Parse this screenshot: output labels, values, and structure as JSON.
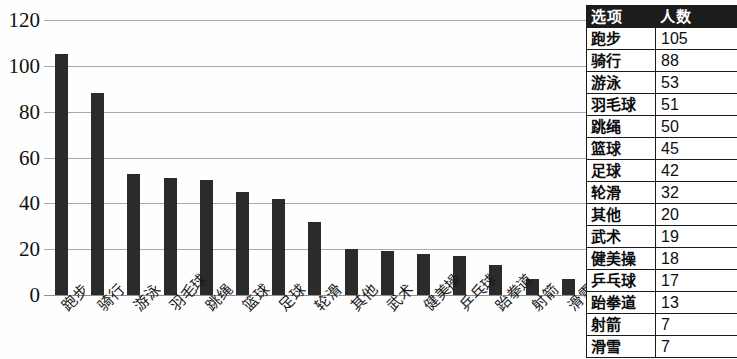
{
  "chart_data": {
    "type": "bar",
    "title": "",
    "xlabel": "",
    "ylabel": "",
    "ylim": [
      0,
      120
    ],
    "y_ticks": [
      0,
      20,
      40,
      60,
      80,
      100,
      120
    ],
    "grid": true,
    "legend": "none",
    "bar_color": "#2b2b2b",
    "categories": [
      "跑步",
      "骑行",
      "游泳",
      "羽毛球",
      "跳绳",
      "篮球",
      "足球",
      "轮滑",
      "其他",
      "武术",
      "健美操",
      "乒乓球",
      "跆拳道",
      "射箭",
      "滑雪"
    ],
    "values": [
      105,
      88,
      53,
      51,
      50,
      45,
      42,
      32,
      20,
      19,
      18,
      17,
      13,
      7,
      7
    ],
    "series": [
      {
        "name": "人数",
        "values": [
          105,
          88,
          53,
          51,
          50,
          45,
          42,
          32,
          20,
          19,
          18,
          17,
          13,
          7,
          7
        ]
      }
    ]
  },
  "table": {
    "headers": [
      "选项",
      "人数"
    ],
    "rows": [
      {
        "option": "跑步",
        "count": "105"
      },
      {
        "option": "骑行",
        "count": "88"
      },
      {
        "option": "游泳",
        "count": "53"
      },
      {
        "option": "羽毛球",
        "count": "51"
      },
      {
        "option": "跳绳",
        "count": "50"
      },
      {
        "option": "篮球",
        "count": "45"
      },
      {
        "option": "足球",
        "count": "42"
      },
      {
        "option": "轮滑",
        "count": "32"
      },
      {
        "option": "其他",
        "count": "20"
      },
      {
        "option": "武术",
        "count": "19"
      },
      {
        "option": "健美操",
        "count": "18"
      },
      {
        "option": "乒乓球",
        "count": "17"
      },
      {
        "option": "跆拳道",
        "count": "13"
      },
      {
        "option": "射箭",
        "count": "7"
      },
      {
        "option": "滑雪",
        "count": "7"
      }
    ]
  },
  "colors": {
    "bar": "#2b2b2b",
    "gridline": "#a9a9a9",
    "table_header_bg": "#1c1c1c",
    "table_header_text": "#ffffff",
    "table_border": "#1b1b1b",
    "background": "#fefefe"
  }
}
